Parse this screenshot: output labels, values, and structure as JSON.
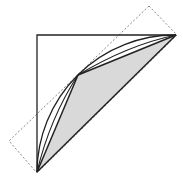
{
  "diagram": {
    "colors": {
      "background": "#ffffff",
      "stroke": "#222222",
      "shade": "#d9d9d9",
      "dashed": "#888888"
    },
    "triangle": {
      "points": [
        [
          37,
          34
        ],
        [
          176,
          35
        ],
        [
          37,
          172
        ]
      ]
    },
    "arc": {
      "from": [
        37,
        172
      ],
      "to": [
        176,
        35
      ],
      "radius": 138
    },
    "shaded_polygon": {
      "points": [
        [
          37,
          172
        ],
        [
          78,
          75
        ],
        [
          176,
          35
        ]
      ]
    },
    "chords": [
      {
        "from": [
          37,
          172
        ],
        "to": [
          78,
          75
        ]
      },
      {
        "from": [
          78,
          75
        ],
        "to": [
          176,
          35
        ]
      }
    ],
    "dashed_rectangle": {
      "points": [
        [
          149,
          6
        ],
        [
          176,
          35
        ],
        [
          37,
          172
        ],
        [
          9,
          141
        ]
      ]
    }
  }
}
